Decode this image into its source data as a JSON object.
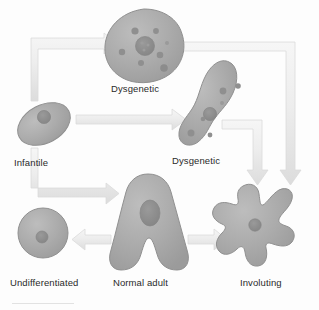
{
  "diagram": {
    "type": "biological-cell-state-diagram",
    "colors": {
      "background": "#fdfdfd",
      "cell_fill": "#a9a9a9",
      "cell_fill_light": "#b6b6b6",
      "cell_stroke": "#8f8f8f",
      "nucleus_fill": "#8d8d8d",
      "vacuole_fill": "#909090",
      "arrow_fill": "#ededed",
      "arrow_stroke": "#d8d8d8",
      "label_text": "#2a2a2a"
    },
    "cells": [
      {
        "id": "dysgenetic-top",
        "label": "Dysgenetic",
        "shape": "irregular-round-blob",
        "nucleus_count": 1,
        "vacuole_count": 6,
        "center": {
          "x": 144,
          "y": 47
        }
      },
      {
        "id": "infantile",
        "label": "Infantile",
        "shape": "tilted-oval",
        "nucleus_count": 1,
        "vacuole_count": 0,
        "center": {
          "x": 44,
          "y": 124
        }
      },
      {
        "id": "dysgenetic-mid",
        "label": "Dysgenetic",
        "shape": "elongated-s-curve",
        "nucleus_count": 1,
        "vacuole_count": 5,
        "center": {
          "x": 214,
          "y": 108
        }
      },
      {
        "id": "undifferentiated",
        "label": "Undifferentiated",
        "shape": "circle",
        "nucleus_count": 1,
        "vacuole_count": 0,
        "center": {
          "x": 43,
          "y": 232
        }
      },
      {
        "id": "normal-adult",
        "label": "Normal adult",
        "shape": "inverted-v-two-legs",
        "nucleus_count": 1,
        "vacuole_count": 0,
        "center": {
          "x": 148,
          "y": 225
        }
      },
      {
        "id": "involuting",
        "label": "Involuting",
        "shape": "five-lobed-star",
        "nucleus_count": 1,
        "vacuole_count": 0,
        "center": {
          "x": 259,
          "y": 226
        }
      }
    ],
    "arrows": [
      {
        "id": "infantile-to-dysgenetic-top",
        "from": "infantile",
        "to": "dysgenetic-top",
        "path": "elbow-up-right",
        "direction": "right"
      },
      {
        "id": "infantile-to-dysgenetic-mid",
        "from": "infantile",
        "to": "dysgenetic-mid",
        "path": "straight-horizontal",
        "direction": "right"
      },
      {
        "id": "infantile-to-normal-adult",
        "from": "infantile",
        "to": "normal-adult",
        "path": "elbow-down-right",
        "direction": "right"
      },
      {
        "id": "dysgenetic-top-to-involuting",
        "from": "dysgenetic-top",
        "to": "involuting",
        "path": "elbow-right-down",
        "direction": "down"
      },
      {
        "id": "dysgenetic-mid-to-involuting",
        "from": "dysgenetic-mid",
        "to": "involuting",
        "path": "elbow-right-down",
        "direction": "down"
      },
      {
        "id": "normal-adult-to-undifferentiated",
        "from": "normal-adult",
        "to": "undifferentiated",
        "path": "straight-horizontal",
        "direction": "left"
      },
      {
        "id": "normal-adult-to-involuting",
        "from": "normal-adult",
        "to": "involuting",
        "path": "straight-horizontal",
        "direction": "right"
      }
    ]
  }
}
